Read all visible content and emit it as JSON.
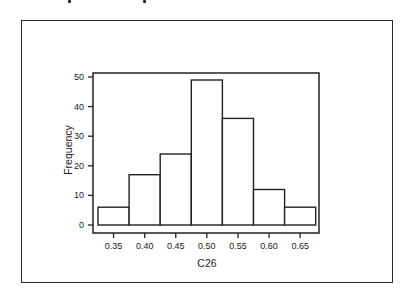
{
  "chart_data": {
    "type": "bar",
    "subtype": "histogram",
    "title": "",
    "xlabel": "C26",
    "ylabel": "Frequency",
    "categories": [
      "0.35",
      "0.40",
      "0.45",
      "0.50",
      "0.55",
      "0.60",
      "0.65"
    ],
    "bin_centers": [
      0.35,
      0.4,
      0.45,
      0.5,
      0.55,
      0.6,
      0.65
    ],
    "values": [
      6,
      17,
      24,
      49,
      36,
      12,
      6
    ],
    "xticks": [
      "0.35",
      "0.40",
      "0.45",
      "0.50",
      "0.55",
      "0.60",
      "0.65"
    ],
    "yticks": [
      "0",
      "10",
      "20",
      "30",
      "40",
      "50"
    ],
    "ylim": [
      0,
      50
    ],
    "grid": false,
    "legend": null
  }
}
